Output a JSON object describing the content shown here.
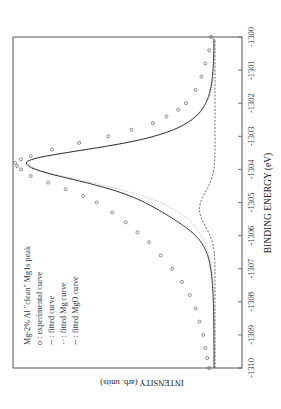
{
  "chart_data": {
    "type": "line",
    "orientation_note": "figure rotated 90 degrees clockwise on page",
    "title": "",
    "xlabel": "BINDING ENERGY (eV)",
    "ylabel": "INTENSITY (arb. units)",
    "xlim": [
      -1310,
      -1300
    ],
    "x_ticks": [
      "-1310",
      "-1309",
      "-1308",
      "-1307",
      "-1306",
      "-1305",
      "-1304",
      "-1303",
      "-1302",
      "-1301",
      "-1300"
    ],
    "grid": false,
    "legend": {
      "position": "upper left",
      "entries": [
        "Mg-2% Al \"clean\" Mg1s peak",
        "o : experimental curve",
        "-- : fitted  curve",
        "·· : fitted Mg  curve",
        "-- : fitted MgO curve"
      ]
    },
    "series": [
      {
        "name": "experimental curve",
        "style": "open circles",
        "x": [
          -1310.0,
          -1309.7,
          -1309.4,
          -1309.0,
          -1308.6,
          -1308.2,
          -1307.8,
          -1307.4,
          -1307.0,
          -1306.6,
          -1306.2,
          -1305.9,
          -1305.6,
          -1305.3,
          -1305.0,
          -1304.8,
          -1304.6,
          -1304.4,
          -1304.2,
          -1304.0,
          -1303.9,
          -1303.8,
          -1303.7,
          -1303.6,
          -1303.4,
          -1303.2,
          -1303.0,
          -1302.8,
          -1302.6,
          -1302.4,
          -1302.2,
          -1302.0,
          -1301.6,
          -1301.2,
          -1300.8,
          -1300.4,
          -1300.0
        ],
        "y": [
          0.03,
          0.04,
          0.05,
          0.06,
          0.08,
          0.1,
          0.13,
          0.17,
          0.22,
          0.28,
          0.34,
          0.4,
          0.46,
          0.53,
          0.61,
          0.68,
          0.77,
          0.86,
          0.95,
          1.0,
          1.02,
          1.03,
          1.0,
          0.95,
          0.84,
          0.7,
          0.55,
          0.43,
          0.32,
          0.25,
          0.19,
          0.15,
          0.1,
          0.07,
          0.05,
          0.03,
          0.02
        ]
      },
      {
        "name": "fitted curve",
        "style": "solid",
        "peak_x": -1303.8,
        "peak_y": 1.0
      },
      {
        "name": "fitted Mg curve",
        "style": "dotted",
        "peak_x": -1303.8,
        "peak_y": 0.97
      },
      {
        "name": "fitted MgO curve",
        "style": "dashed",
        "peak_x": -1305.2,
        "peak_y": 0.08
      }
    ]
  }
}
